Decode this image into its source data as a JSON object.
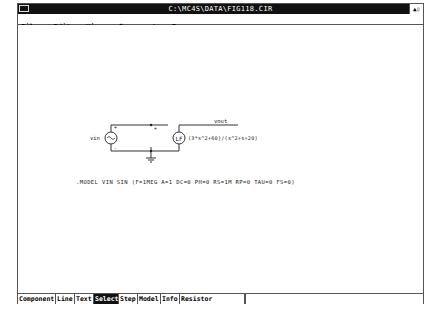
{
  "window": {
    "title": "C:\\MC4S\\DATA\\FIG118.CIR",
    "maximize_glyph": "▲▯"
  },
  "menu": {
    "items": [
      {
        "label": "File"
      },
      {
        "label": "Edit"
      },
      {
        "label": "View"
      },
      {
        "label": "Component"
      },
      {
        "label": "Run"
      }
    ]
  },
  "schematic": {
    "source_label": "vin",
    "source_plus": "+",
    "source_minus": "-",
    "node_plus": "+",
    "output_label": "vout",
    "lf_label": "LF",
    "lf_expression": "(3*s^2+60)/(s^2+s+20)",
    "model_line": ".MODEL VIN SIN (F=1MEG A=1 DC=0 PH=0 RS=1M RP=0 TAU=0 FS=0)"
  },
  "toolbar": {
    "buttons": [
      {
        "label": "Component",
        "active": false
      },
      {
        "label": "Line",
        "active": false
      },
      {
        "label": "Text",
        "active": false
      },
      {
        "label": "Select",
        "active": true
      },
      {
        "label": "Step",
        "active": false
      },
      {
        "label": "Model",
        "active": false
      },
      {
        "label": "Info",
        "active": false
      },
      {
        "label": "Resistor",
        "active": false
      }
    ],
    "field_value": ""
  }
}
